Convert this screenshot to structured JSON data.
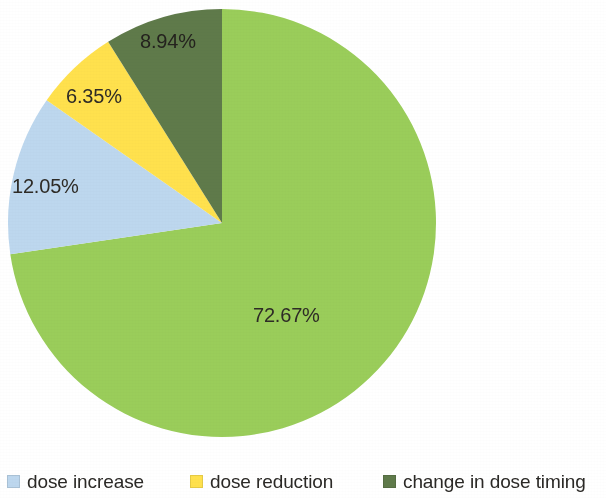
{
  "chart_data": {
    "type": "pie",
    "title": "",
    "subtitle": "",
    "xlabel": "",
    "ylabel": "",
    "grid": false,
    "legend_position": "bottom",
    "start_angle_deg": 0,
    "direction": "clockwise",
    "units": "percent",
    "categories": [
      "no change",
      "change in dose timing",
      "dose reduction",
      "dose increase"
    ],
    "values": [
      72.67,
      8.94,
      6.35,
      12.05
    ],
    "labels": [
      "72.67%",
      "8.94%",
      "6.35%",
      "12.05%"
    ],
    "colors": [
      "#9ACD5A",
      "#5F7A4A",
      "#FFE14D",
      "#BDD7EE"
    ],
    "slices": [
      {
        "name": "no change",
        "value": 72.67,
        "label": "72.67%",
        "color": "#9ACD5A",
        "in_legend": false,
        "start_deg": 0,
        "end_deg": 261.612
      },
      {
        "name": "dose increase",
        "value": 12.05,
        "label": "12.05%",
        "color": "#BDD7EE",
        "in_legend": true,
        "start_deg": 261.612,
        "end_deg": 304.992
      },
      {
        "name": "dose reduction",
        "value": 6.35,
        "label": "6.35%",
        "color": "#FFE14D",
        "in_legend": true,
        "start_deg": 304.992,
        "end_deg": 327.852
      },
      {
        "name": "change in dose timing",
        "value": 8.94,
        "label": "8.94%",
        "color": "#5F7A4A",
        "in_legend": true,
        "start_deg": 327.852,
        "end_deg": 360
      }
    ]
  },
  "labels": {
    "main": "72.67%",
    "increase": "12.05%",
    "reduction": "6.35%",
    "timing": "8.94%"
  },
  "legend": {
    "items": [
      {
        "label": "dose increase",
        "color": "#BDD7EE"
      },
      {
        "label": "dose reduction",
        "color": "#FFE14D"
      },
      {
        "label": "change in dose timing",
        "color": "#5F7A4A"
      }
    ]
  }
}
